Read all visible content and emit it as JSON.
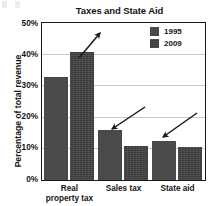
{
  "chart_data": {
    "type": "bar",
    "title": "Taxes and State Aid",
    "xlabel": "",
    "ylabel": "Percentage of total revenue",
    "categories": [
      "Real property tax",
      "Sales tax",
      "State aid"
    ],
    "series": [
      {
        "name": "1995",
        "values": [
          33,
          16,
          12.5
        ],
        "color": "#4a4a4a"
      },
      {
        "name": "2009",
        "values": [
          41,
          11,
          10.5
        ],
        "color": "#3a3a3a"
      }
    ],
    "ylim": [
      0,
      50
    ],
    "yticks": [
      "0%",
      "10%",
      "20%",
      "30%",
      "40%",
      "50%"
    ],
    "ytick_values": [
      0,
      10,
      20,
      30,
      40,
      50
    ],
    "grid": true,
    "legend_position": "top-right",
    "annotations": [
      {
        "label": "increase-arrow-real-property-tax",
        "direction": "up-right",
        "target_category": "Real property tax"
      },
      {
        "label": "decrease-arrow-sales-tax",
        "direction": "down-left",
        "target_category": "Sales tax"
      },
      {
        "label": "decrease-arrow-state-aid",
        "direction": "down-left",
        "target_category": "State aid"
      }
    ]
  },
  "category_lines": [
    [
      "Real",
      "property tax"
    ],
    [
      "Sales tax"
    ],
    [
      "State aid"
    ]
  ],
  "legend": {
    "items": [
      {
        "label": "1995"
      },
      {
        "label": "2009"
      }
    ]
  }
}
